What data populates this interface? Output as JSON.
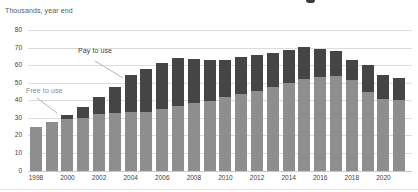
{
  "chart_data": {
    "type": "bar",
    "stacked": true,
    "title": "Thousands, year end",
    "grid": true,
    "legend_position": "inline-annotations",
    "ylim": [
      0,
      80
    ],
    "y_ticks": [
      0,
      10,
      20,
      30,
      40,
      50,
      60,
      70,
      80
    ],
    "categories": [
      "1998",
      "1999",
      "2000",
      "2001",
      "2002",
      "2003",
      "2004",
      "2005",
      "2006",
      "2007",
      "2008",
      "2009",
      "2010",
      "2011",
      "2012",
      "2013",
      "2014",
      "2015",
      "2016",
      "2017",
      "2018",
      "2019",
      "2020",
      "2021"
    ],
    "x_tick_labels": [
      "1998",
      "2000",
      "2002",
      "2004",
      "2006",
      "2008",
      "2010",
      "2012",
      "2014",
      "2016",
      "2018",
      "2020"
    ],
    "series": [
      {
        "name": "Free to use",
        "color": "#8e8e8e",
        "values": [
          24.5,
          27.9,
          29.5,
          30.0,
          31.9,
          33.0,
          33.4,
          33.4,
          34.8,
          36.9,
          38.4,
          39.7,
          41.8,
          43.6,
          45.4,
          47.3,
          49.6,
          52.1,
          53.5,
          54.0,
          51.3,
          44.8,
          41.0,
          40.2
        ]
      },
      {
        "name": "Pay to use",
        "color": "#454545",
        "values": [
          0,
          0,
          2.0,
          6.2,
          10.0,
          14.3,
          21.1,
          24.4,
          26.2,
          27.1,
          25.0,
          23.2,
          21.0,
          21.2,
          20.3,
          19.6,
          18.9,
          18.2,
          15.6,
          14.2,
          11.4,
          15.4,
          13.2,
          12.6
        ]
      }
    ],
    "annotations": [
      {
        "text": "Pay to use",
        "points_to": "2004 pay segment"
      },
      {
        "text": "Free to use",
        "points_to": "2000 free segment"
      }
    ]
  }
}
